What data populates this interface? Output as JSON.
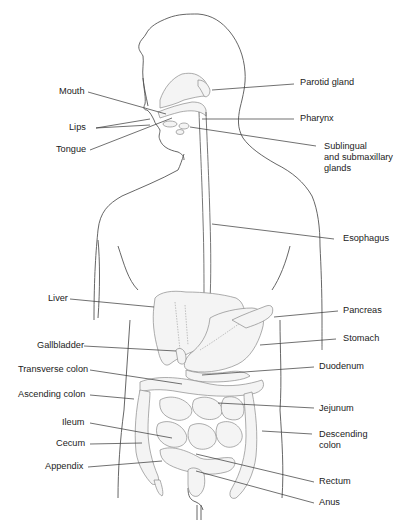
{
  "figure": {
    "labels_left": [
      {
        "id": "mouth",
        "text": "Mouth"
      },
      {
        "id": "lips",
        "text": "Lips"
      },
      {
        "id": "tongue",
        "text": "Tongue"
      },
      {
        "id": "liver",
        "text": "Liver"
      },
      {
        "id": "gallbladder",
        "text": "Gallbladder"
      },
      {
        "id": "transverse_colon",
        "text": "Transverse colon"
      },
      {
        "id": "ascending_colon",
        "text": "Ascending colon"
      },
      {
        "id": "ileum",
        "text": "Ileum"
      },
      {
        "id": "cecum",
        "text": "Cecum"
      },
      {
        "id": "appendix",
        "text": "Appendix"
      }
    ],
    "labels_right": [
      {
        "id": "parotid_gland",
        "text": "Parotid gland"
      },
      {
        "id": "pharynx",
        "text": "Pharynx"
      },
      {
        "id": "sublingual_line1",
        "text": "Sublingual"
      },
      {
        "id": "sublingual_line2",
        "text": "and submaxillary"
      },
      {
        "id": "sublingual_line3",
        "text": "glands"
      },
      {
        "id": "esophagus",
        "text": "Esophagus"
      },
      {
        "id": "pancreas",
        "text": "Pancreas"
      },
      {
        "id": "stomach",
        "text": "Stomach"
      },
      {
        "id": "duodenum",
        "text": "Duodenum"
      },
      {
        "id": "jejunum",
        "text": "Jejunum"
      },
      {
        "id": "descending_line1",
        "text": "Descending"
      },
      {
        "id": "descending_line2",
        "text": "colon"
      },
      {
        "id": "rectum",
        "text": "Rectum"
      },
      {
        "id": "anus",
        "text": "Anus"
      }
    ]
  }
}
